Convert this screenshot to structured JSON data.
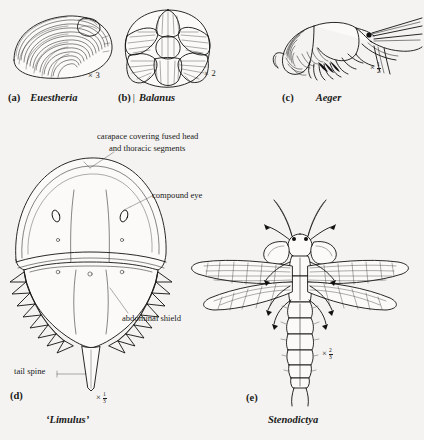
{
  "figure": {
    "type": "scientific-illustration-plate",
    "background_color": "#f4f3f1",
    "ink_color": "#111111"
  },
  "panels": [
    {
      "id": "a",
      "letter": "(a)",
      "name": "Euestheria",
      "name_style": "italic-bold",
      "magnification": "× 3",
      "mag_kind": "whole",
      "mag_whole": "3",
      "icon": "clam-shrimp-carapace-icon",
      "description": "Bivalved clam shrimp carapace with concentric growth lines"
    },
    {
      "id": "b",
      "letter": "(b)",
      "separator": "|",
      "name": "Balanus",
      "name_style": "italic-bold",
      "magnification": "× 2",
      "mag_kind": "whole",
      "mag_whole": "2",
      "icon": "acorn-barnacle-icon",
      "description": "Acorn barnacle viewed from above showing radiating calcareous plates"
    },
    {
      "id": "c",
      "letter": "(c)",
      "name": "Aeger",
      "name_style": "italic-bold",
      "magnification": "× ½",
      "mag_kind": "fraction",
      "mag_num": "1",
      "mag_den": "2",
      "icon": "fossil-shrimp-icon",
      "description": "Fossil decapod shrimp in lateral view with long antennae and walking legs"
    },
    {
      "id": "d",
      "letter": "(d)",
      "name": "‘Limulus’",
      "name_style": "italic-bold-quoted",
      "magnification": "× ⅓",
      "mag_kind": "fraction",
      "mag_num": "1",
      "mag_den": "3",
      "icon": "horseshoe-crab-icon",
      "description": "Horseshoe crab in dorsal view",
      "leaders": [
        {
          "id": "carapace",
          "lines": [
            "carapace covering  fused head",
            "and thoracic  segments"
          ],
          "points_to": "carapace-dome"
        },
        {
          "id": "compound-eye",
          "lines": [
            "compound eye"
          ],
          "points_to": "right-compound-eye"
        },
        {
          "id": "abdominal-shield",
          "lines": [
            "abdominal shield"
          ],
          "points_to": "abdominal-shield-margin"
        },
        {
          "id": "tail-spine",
          "lines": [
            "tail spine"
          ],
          "points_to": "telson"
        }
      ]
    },
    {
      "id": "e",
      "letter": "(e)",
      "name": "Stenodictya",
      "name_style": "italic-bold",
      "magnification": "× ⅔",
      "mag_kind": "fraction",
      "mag_num": "2",
      "mag_den": "3",
      "icon": "palaeodictyopteran-insect-icon",
      "description": "Fossil winged insect in dorsal view with two pairs of veined wings and segmented abdomen"
    }
  ]
}
